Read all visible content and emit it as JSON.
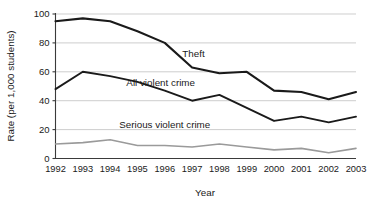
{
  "chart_data": {
    "type": "line",
    "title": "",
    "xlabel": "Year",
    "ylabel": "Rate (per 1,000 students)",
    "categories": [
      "1992",
      "1993",
      "1994",
      "1995",
      "1996",
      "1997",
      "1998",
      "1999",
      "2000",
      "2001",
      "2002",
      "2003"
    ],
    "x": [
      1992,
      1993,
      1994,
      1995,
      1996,
      1997,
      1998,
      1999,
      2000,
      2001,
      2002,
      2003
    ],
    "ylim": [
      0,
      100
    ],
    "yticks": [
      0,
      20,
      40,
      60,
      80,
      100
    ],
    "ytick_labels": [
      "0",
      "20",
      "40",
      "60",
      "80",
      "100"
    ],
    "grid": "horizontal",
    "legend": "inline-labels",
    "series": [
      {
        "name": "Theft",
        "color": "#1a1a1a",
        "width": 2.1,
        "label_x": 1997.05,
        "label_y": 70,
        "values": [
          95,
          97,
          95,
          88,
          80,
          63,
          59,
          60,
          47,
          46,
          41,
          46
        ]
      },
      {
        "name": "All violent crime",
        "color": "#1a1a1a",
        "width": 1.9,
        "label_x": 1995.85,
        "label_y": 50,
        "values": [
          48,
          60,
          57,
          53,
          47,
          40,
          44,
          35,
          26,
          29,
          25,
          29
        ]
      },
      {
        "name": "Serious violent crime",
        "color": "#9a9a9a",
        "width": 1.6,
        "label_x": 1996.0,
        "label_y": 21,
        "values": [
          10,
          11,
          13,
          9,
          9,
          8,
          10,
          8,
          6,
          7,
          4,
          7
        ]
      }
    ]
  },
  "axis": {
    "y_title": "Rate (per 1,000 students)",
    "x_title": "Year"
  }
}
